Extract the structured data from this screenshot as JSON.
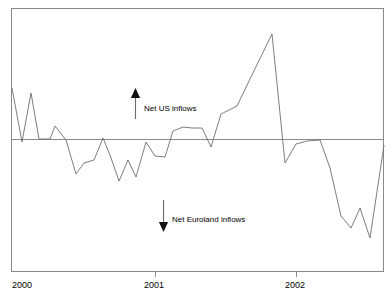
{
  "figure": {
    "name": "net-inflows-line-chart",
    "background_color": "#ffffff",
    "line_color": "#6e6e6e",
    "axis_color": "#8a8a8a",
    "clipped_title": "",
    "frame": {
      "left": 11,
      "top": 8,
      "right": 384,
      "bottom": 272
    }
  },
  "axis": {
    "tick_labels": [
      "2000",
      "2001",
      "2002"
    ],
    "tick_x_px": [
      14,
      155,
      296
    ],
    "zero_line_y_px": 139
  },
  "annotations": [
    {
      "id": "net-us-inflows",
      "label": "Net US inflows",
      "direction": "up",
      "arrow_x_px": 135,
      "arrow_top_y_px": 88,
      "arrow_bottom_y_px": 119,
      "label_x_px": 144,
      "label_y_px": 104
    },
    {
      "id": "net-euroland-inflows",
      "label": "Net Euroland inflows",
      "direction": "down",
      "arrow_x_px": 163,
      "arrow_top_y_px": 200,
      "arrow_bottom_y_px": 232,
      "label_x_px": 172,
      "label_y_px": 215
    }
  ],
  "chart_data": {
    "type": "line",
    "title": "",
    "subtitle": "",
    "xlabel": "",
    "ylabel": "",
    "grid": false,
    "legend_position": "none",
    "zero_reference_line": 0,
    "xlim": [
      "2000-01",
      "2002-12"
    ],
    "x_tick_labels": [
      "2000",
      "2001",
      "2002"
    ],
    "y_axis_labeled": false,
    "series": [
      {
        "name": "Net inflows",
        "description": "Net US inflows above zero line, Net Euroland inflows below zero line",
        "x": [
          "2000-01",
          "2000-02",
          "2000-03",
          "2000-04",
          "2000-05",
          "2000-06",
          "2000-07",
          "2000-08",
          "2000-09",
          "2000-10",
          "2000-11",
          "2000-12",
          "2001-01",
          "2001-02",
          "2001-03",
          "2001-04",
          "2001-05",
          "2001-06",
          "2001-07",
          "2001-08",
          "2001-09",
          "2001-10",
          "2001-11",
          "2001-12",
          "2002-01",
          "2002-02",
          "2002-03",
          "2002-04",
          "2002-05",
          "2002-06",
          "2002-07",
          "2002-08",
          "2002-09",
          "2002-10",
          "2002-11",
          "2002-12"
        ],
        "values": [
          51,
          -3,
          46,
          0,
          0,
          17,
          -1,
          -40,
          -30,
          -28,
          1,
          -22,
          -46,
          -27,
          -42,
          -3,
          -16,
          -15,
          7,
          11,
          10,
          10,
          -6,
          24,
          80,
          26,
          1,
          -24,
          -7,
          -4,
          -4,
          -21,
          -59,
          -70,
          -57,
          -75
        ],
        "pixel_points": [
          [
            12,
            88
          ],
          [
            22,
            142
          ],
          [
            31,
            93
          ],
          [
            39,
            139
          ],
          [
            50,
            139
          ],
          [
            55,
            126
          ],
          [
            66,
            140
          ],
          [
            76,
            174
          ],
          [
            84,
            163
          ],
          [
            94,
            160
          ],
          [
            103,
            138
          ],
          [
            110,
            155
          ],
          [
            119,
            181
          ],
          [
            128,
            160
          ],
          [
            136,
            177
          ],
          [
            146,
            142
          ],
          [
            155,
            156
          ],
          [
            165,
            157
          ],
          [
            173,
            131
          ],
          [
            183,
            127
          ],
          [
            192,
            128
          ],
          [
            202,
            128
          ],
          [
            211,
            147
          ],
          [
            221,
            114
          ],
          [
            237,
            106
          ],
          [
            250,
            79
          ],
          [
            272,
            34
          ],
          [
            285,
            163
          ],
          [
            296,
            144
          ],
          [
            307,
            141
          ],
          [
            320,
            140
          ],
          [
            330,
            168
          ],
          [
            341,
            216
          ],
          [
            351,
            228
          ],
          [
            360,
            208
          ],
          [
            370,
            238
          ],
          [
            384,
            145
          ]
        ]
      }
    ]
  }
}
